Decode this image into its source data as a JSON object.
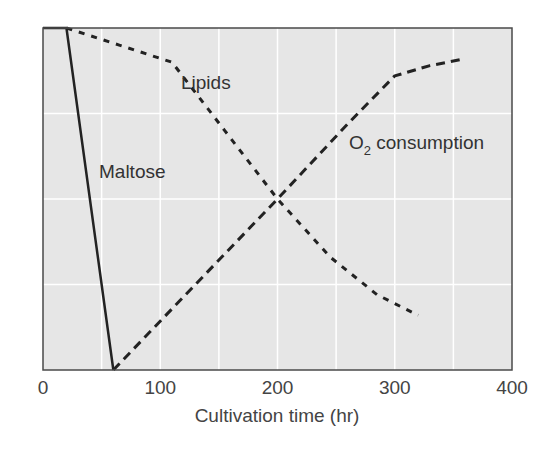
{
  "chart_data": {
    "type": "line",
    "title": "",
    "xlabel": "Cultivation time (hr)",
    "ylabel": "",
    "xlim": [
      0,
      400
    ],
    "ylim": [
      0,
      100
    ],
    "x_ticks": [
      0,
      100,
      200,
      300,
      400
    ],
    "x_tick_labels": [
      "0",
      "100",
      "200",
      "300",
      "400"
    ],
    "y_ticks": [],
    "grid": {
      "on": true,
      "x_step": 50,
      "y_step": 25,
      "color": "#ffffff"
    },
    "legend": {
      "position": "inline-labels"
    },
    "plot_background": "#e6e6e6",
    "series": [
      {
        "name": "Maltose",
        "style": "solid",
        "color": "#222222",
        "x": [
          0,
          20,
          60
        ],
        "values": [
          100,
          100,
          0
        ]
      },
      {
        "name": "Lipids",
        "style": "short-dash",
        "color": "#222222",
        "x": [
          20,
          65,
          110,
          155,
          200,
          245,
          285,
          320
        ],
        "values": [
          100,
          95,
          90,
          70,
          50,
          33,
          22,
          16
        ]
      },
      {
        "name": "O2 consumption",
        "style": "long-dash",
        "color": "#222222",
        "x": [
          60,
          130,
          200,
          260,
          300,
          330,
          360
        ],
        "values": [
          0,
          25,
          50,
          72,
          86,
          89,
          91
        ]
      }
    ],
    "annotations": [
      {
        "text": "Lipids",
        "x": 150,
        "y": 85
      },
      {
        "text": "Maltose",
        "x": 75,
        "y": 58
      },
      {
        "text": "O2 consumption",
        "subscript": "2",
        "x": 255,
        "y": 66
      }
    ]
  },
  "labels": {
    "maltose": "Maltose",
    "lipids": "Lipids",
    "o2_prefix": "O",
    "o2_sub": "2",
    "o2_suffix": " consumption",
    "x_axis_title": "Cultivation time (hr)"
  }
}
